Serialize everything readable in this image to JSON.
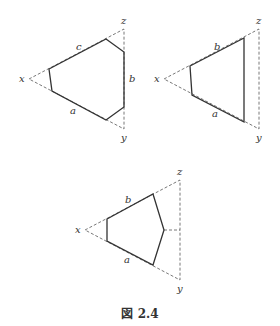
{
  "figure": {
    "caption": "図 2.4",
    "panels": [
      {
        "id": "hexagon",
        "triangle": {
          "x": [
            29,
            79
          ],
          "z": [
            124,
            29
          ],
          "y": [
            124,
            129
          ]
        },
        "polygon": [
          [
            49,
            69
          ],
          [
            106,
            39
          ],
          [
            124,
            52
          ],
          [
            124,
            107
          ],
          [
            106,
            120
          ],
          [
            52,
            91
          ]
        ],
        "vertex_labels": {
          "x": "x",
          "y": "y",
          "z": "z"
        },
        "side_labels": [
          {
            "text": "c",
            "pos": [
              76,
              50
            ]
          },
          {
            "text": "b",
            "pos": [
              129,
              82
            ]
          },
          {
            "text": "a",
            "pos": [
              70,
              114
            ]
          }
        ],
        "extra_dashed": []
      },
      {
        "id": "quadrilateral",
        "triangle": {
          "x": [
            164,
            79
          ],
          "z": [
            259,
            29
          ],
          "y": [
            259,
            129
          ]
        },
        "polygon": [
          [
            190,
            66
          ],
          [
            244,
            38
          ],
          [
            244,
            122
          ],
          [
            192,
            95
          ]
        ],
        "vertex_labels": {
          "x": "x",
          "y": "y",
          "z": "z"
        },
        "side_labels": [
          {
            "text": "b",
            "pos": [
              214,
              50
            ]
          },
          {
            "text": "a",
            "pos": [
              212,
              117
            ]
          }
        ],
        "extra_dashed": []
      },
      {
        "id": "pentagon",
        "triangle": {
          "x": [
            85,
            230
          ],
          "z": [
            180,
            180
          ],
          "y": [
            180,
            280
          ]
        },
        "polygon": [
          [
            107,
            219
          ],
          [
            153,
            194
          ],
          [
            164,
            230
          ],
          [
            153,
            265
          ],
          [
            107,
            241
          ]
        ],
        "vertex_labels": {
          "x": "x",
          "y": "y",
          "z": "z"
        },
        "side_labels": [
          {
            "text": "b",
            "pos": [
              125,
              203
            ]
          },
          {
            "text": "a",
            "pos": [
              124,
              263
            ]
          }
        ],
        "extra_dashed": [
          [
            [
              164,
              230
            ],
            [
              180,
              230
            ]
          ]
        ]
      }
    ]
  }
}
